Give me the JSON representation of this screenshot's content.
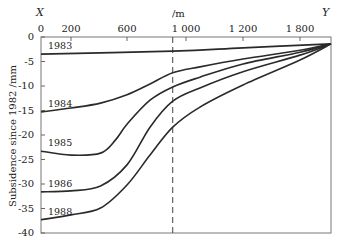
{
  "chart_data": {
    "type": "line",
    "title": "",
    "xlabel": "/m",
    "ylabel": "Subsidence since 1982 /mm",
    "x_axis_position": "top",
    "x_endpoints": {
      "left": "X",
      "right": "Y"
    },
    "x_tick_labels": [
      "0",
      "200",
      "600",
      "1 000",
      "1 200",
      "1 800"
    ],
    "x_ticks": [
      0,
      200,
      600,
      1000,
      1200,
      1800
    ],
    "x_end_value": 2000,
    "y_ticks": [
      0,
      -5,
      -10,
      -15,
      -20,
      -25,
      -30,
      -35,
      -40
    ],
    "y_tick_labels": [
      "0",
      "-5",
      "-10",
      "-15",
      "-20",
      "-25",
      "-30",
      "-35",
      "-40"
    ],
    "ylim": [
      -40,
      0
    ],
    "grid": false,
    "legend": "inline labels at left of each curve",
    "reference_line": {
      "style": "dashed",
      "x": 910
    },
    "series": [
      {
        "name": "1983",
        "points": [
          [
            0,
            -3.5
          ],
          [
            910,
            -2.9
          ],
          [
            1200,
            -2.2
          ],
          [
            2000,
            -1.4
          ]
        ]
      },
      {
        "name": "1984",
        "points": [
          [
            0,
            -15.3
          ],
          [
            200,
            -14.5
          ],
          [
            411,
            -13.5
          ],
          [
            600,
            -11.8
          ],
          [
            756,
            -9.6
          ],
          [
            910,
            -7.3
          ],
          [
            1049,
            -6.1
          ],
          [
            1200,
            -4.5
          ],
          [
            1800,
            -2.7
          ],
          [
            2000,
            -1.4
          ]
        ]
      },
      {
        "name": "1985",
        "points": [
          [
            0,
            -23.3
          ],
          [
            200,
            -24.1
          ],
          [
            411,
            -23.7
          ],
          [
            518,
            -21.0
          ],
          [
            600,
            -17.8
          ],
          [
            756,
            -12.9
          ],
          [
            910,
            -10.2
          ],
          [
            1049,
            -8.2
          ],
          [
            1200,
            -5.5
          ],
          [
            1800,
            -3.1
          ],
          [
            2000,
            -1.4
          ]
        ]
      },
      {
        "name": "1986",
        "points": [
          [
            0,
            -31.6
          ],
          [
            200,
            -31.4
          ],
          [
            411,
            -30.4
          ],
          [
            600,
            -26.1
          ],
          [
            756,
            -18.4
          ],
          [
            910,
            -13.1
          ],
          [
            1049,
            -10.4
          ],
          [
            1200,
            -7.1
          ],
          [
            1800,
            -3.7
          ],
          [
            2000,
            -1.4
          ]
        ]
      },
      {
        "name": "1988",
        "points": [
          [
            0,
            -37.3
          ],
          [
            200,
            -36.3
          ],
          [
            411,
            -34.9
          ],
          [
            600,
            -30.2
          ],
          [
            756,
            -24.1
          ],
          [
            910,
            -18.4
          ],
          [
            1049,
            -14.3
          ],
          [
            1200,
            -9.8
          ],
          [
            1800,
            -4.7
          ],
          [
            2000,
            -1.4
          ]
        ]
      }
    ]
  },
  "labels": {
    "x_left": "X",
    "x_right": "Y",
    "x_unit": "/m",
    "ylabel": "Subsidence since 1982 /mm",
    "series_labels": [
      "1983",
      "1984",
      "1985",
      "1986",
      "1988"
    ]
  },
  "style": {
    "line_color": "#2a2a2a",
    "axis_color": "#555555",
    "background": "#ffffff"
  }
}
